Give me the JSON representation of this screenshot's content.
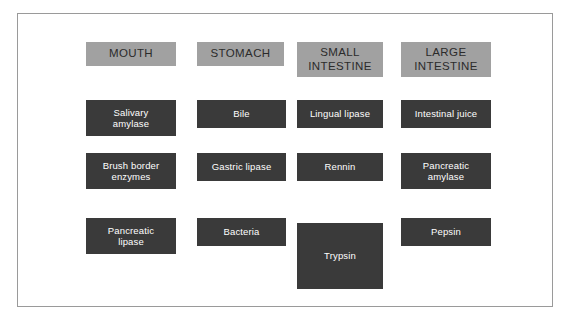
{
  "diagram": {
    "title_visible": false,
    "colors": {
      "header_fill": "#a1a1a1",
      "header_text": "#2b2b2b",
      "item_fill": "#3a3a3a",
      "item_text": "#ffffff",
      "frame_border": "#9a9a9a",
      "page_background": "#ffffff"
    },
    "columns": [
      {
        "header": "MOUTH",
        "items": [
          "Salivary\namylase",
          "Brush border\nenzymes",
          "Pancreatic\nlipase"
        ]
      },
      {
        "header": "STOMACH",
        "items": [
          "Bile",
          "Gastric lipase",
          "Bacteria"
        ]
      },
      {
        "header": "SMALL\nINTESTINE",
        "items": [
          "Lingual lipase",
          "Rennin",
          "Trypsin"
        ]
      },
      {
        "header": "LARGE\nINTESTINE",
        "items": [
          "Intestinal juice",
          "Pancreatic\namylase",
          "Pepsin"
        ]
      }
    ]
  }
}
